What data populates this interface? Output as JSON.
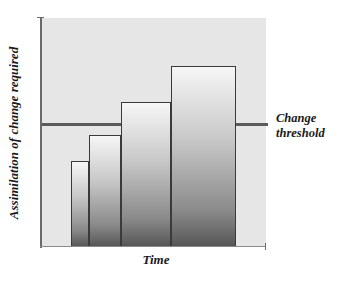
{
  "chart_data": {
    "type": "bar",
    "title": "",
    "xlabel": "Time",
    "ylabel": "Assimilation of change required",
    "categories": [
      "1",
      "2",
      "3",
      "4"
    ],
    "values": [
      38,
      49,
      63,
      79
    ],
    "ylim": [
      0,
      100
    ],
    "bar_widths_relative": [
      18,
      32,
      50,
      65
    ],
    "annotations": [
      {
        "type": "hline",
        "y": 54,
        "label": "Change threshold"
      }
    ],
    "grid": false,
    "legend": null
  },
  "labels": {
    "y_axis": "Assimilation of change required",
    "x_axis": "Time",
    "threshold_line1": "Change",
    "threshold_line2": "threshold"
  },
  "colors": {
    "plot_background": "#e6e6e6",
    "threshold_line": "#5a5a5a",
    "bar_border": "#3a3a3a",
    "bar_gradient_top": "#f6f6f6",
    "bar_gradient_bottom": "#555555"
  },
  "geometry": {
    "bars": [
      {
        "left": 71,
        "width": 18,
        "top": 161
      },
      {
        "left": 89,
        "width": 32,
        "top": 135
      },
      {
        "left": 121,
        "width": 50,
        "top": 102
      },
      {
        "left": 171,
        "width": 65,
        "top": 66
      }
    ],
    "baseline": 247
  }
}
